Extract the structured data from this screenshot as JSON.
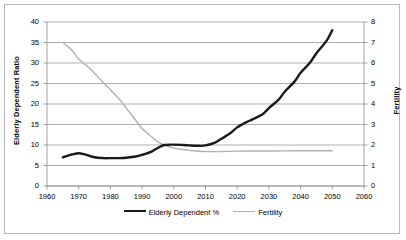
{
  "chart_data": {
    "type": "line",
    "title": "",
    "xlabel": "",
    "ylabel": "Elderly Dependent Ratio",
    "ylabel_right": "Fertility",
    "xlim": [
      1960,
      2060
    ],
    "ylim": [
      0,
      40
    ],
    "ylim_right": [
      0,
      8
    ],
    "xticks": [
      1960,
      1970,
      1980,
      1990,
      2000,
      2010,
      2020,
      2030,
      2040,
      2050,
      2060
    ],
    "yticks": [
      0,
      5,
      10,
      15,
      20,
      25,
      30,
      35,
      40
    ],
    "yticks_right": [
      0,
      1,
      2,
      3,
      4,
      5,
      6,
      7,
      8
    ],
    "grid": true,
    "legend_position": "bottom",
    "series": [
      {
        "name": "Elderly Dependent %",
        "axis": "left",
        "color": "#1a1a1a",
        "width": 2.4,
        "x": [
          1965,
          1968,
          1970,
          1972,
          1975,
          1978,
          1980,
          1983,
          1985,
          1988,
          1990,
          1993,
          1995,
          1997,
          2000,
          2003,
          2005,
          2008,
          2010,
          2013,
          2015,
          2018,
          2020,
          2023,
          2025,
          2028,
          2030,
          2033,
          2035,
          2038,
          2040,
          2043,
          2045,
          2048,
          2050
        ],
        "values": [
          7.0,
          7.7,
          8.0,
          7.7,
          7.0,
          6.8,
          6.8,
          6.8,
          6.9,
          7.2,
          7.6,
          8.4,
          9.3,
          10.0,
          10.1,
          10.0,
          9.9,
          9.8,
          9.9,
          10.6,
          11.5,
          13.0,
          14.3,
          15.6,
          16.3,
          17.5,
          19.0,
          21.0,
          23.0,
          25.4,
          27.6,
          30.1,
          32.4,
          35.2,
          38.0
        ]
      },
      {
        "name": "Fertility",
        "axis": "right",
        "color": "#b0b0b0",
        "width": 1.4,
        "x": [
          1965,
          1968,
          1970,
          1973,
          1975,
          1978,
          1980,
          1983,
          1985,
          1988,
          1990,
          1993,
          1995,
          1997,
          2000,
          2003,
          2005,
          2010,
          2015,
          2020,
          2030,
          2040,
          2050
        ],
        "values": [
          7.0,
          6.6,
          6.2,
          5.8,
          5.5,
          5.0,
          4.7,
          4.2,
          3.8,
          3.2,
          2.8,
          2.4,
          2.15,
          2.0,
          1.85,
          1.78,
          1.74,
          1.68,
          1.68,
          1.7,
          1.71,
          1.72,
          1.72
        ]
      }
    ]
  },
  "legend": {
    "items": [
      {
        "label": "Elderly Dependent %",
        "style": "black"
      },
      {
        "label": "Fertility",
        "style": "grey"
      }
    ]
  }
}
